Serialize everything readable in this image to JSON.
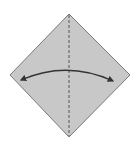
{
  "diagram": {
    "type": "origami-fold-step",
    "paper": {
      "shape": "square-diamond",
      "fill": "#c8c8c8",
      "stroke": "#7a7a7a",
      "vertices": {
        "top": [
          69,
          14
        ],
        "right": [
          130,
          75
        ],
        "bottom": [
          69,
          137
        ],
        "left": [
          10,
          75
        ]
      }
    },
    "crease": {
      "style": "dashed",
      "orientation": "vertical",
      "from": [
        69,
        14
      ],
      "to": [
        69,
        137
      ],
      "color": "#555555"
    },
    "arrow": {
      "style": "curved-double-headed",
      "from": [
        21,
        80
      ],
      "to": [
        113,
        81
      ],
      "peak": [
        69,
        70
      ],
      "color": "#333333"
    }
  }
}
